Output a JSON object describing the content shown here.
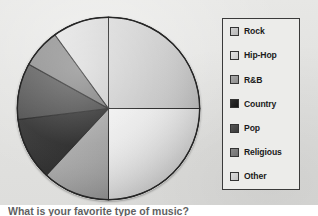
{
  "figure": {
    "caption": "What is your favorite type of music?",
    "background_color": "#e3e3e1"
  },
  "legend": {
    "title": "",
    "position": "right",
    "border_color": "#3a3a3a",
    "background_color": "#ececea",
    "items": [
      {
        "label": "Rock",
        "color": "#d0d0d0"
      },
      {
        "label": "Hip-Hop",
        "color": "#e4e4e4"
      },
      {
        "label": "R&B",
        "color": "#a8a8a8"
      },
      {
        "label": "Country",
        "color": "#2e2e2e"
      },
      {
        "label": "Pop",
        "color": "#555555"
      },
      {
        "label": "Religious",
        "color": "#8a8a8a"
      },
      {
        "label": "Other",
        "color": "#dcdcdc"
      }
    ]
  },
  "chart_data": {
    "type": "pie",
    "title": "What is your favorite type of music?",
    "xlabel": "",
    "ylabel": "",
    "legend_position": "right",
    "grid": false,
    "start_angle_deg": 0,
    "direction": "clockwise",
    "categories": [
      "Rock",
      "Hip-Hop",
      "R&B",
      "Country",
      "Pop",
      "Religious",
      "Other"
    ],
    "values": [
      25,
      25,
      12,
      11,
      10,
      7,
      10
    ],
    "unit": "percent",
    "slices": [
      {
        "label": "Rock",
        "percent": 25,
        "angle_deg": 90,
        "color": "#d0d0d0",
        "start_deg": 0,
        "end_deg": 90
      },
      {
        "label": "Hip-Hop",
        "percent": 25,
        "angle_deg": 90,
        "color": "#e4e4e4",
        "start_deg": 90,
        "end_deg": 180
      },
      {
        "label": "R&B",
        "percent": 12,
        "angle_deg": 43,
        "color": "#a8a8a8",
        "start_deg": 180,
        "end_deg": 223
      },
      {
        "label": "Country",
        "percent": 11,
        "angle_deg": 40,
        "color": "#2e2e2e",
        "start_deg": 223,
        "end_deg": 263
      },
      {
        "label": "Pop",
        "percent": 10,
        "angle_deg": 36,
        "color": "#555555",
        "start_deg": 263,
        "end_deg": 299
      },
      {
        "label": "Religious",
        "percent": 7,
        "angle_deg": 25,
        "color": "#8a8a8a",
        "start_deg": 299,
        "end_deg": 324
      },
      {
        "label": "Other",
        "percent": 10,
        "angle_deg": 36,
        "color": "#dcdcdc",
        "start_deg": 324,
        "end_deg": 360
      }
    ]
  }
}
